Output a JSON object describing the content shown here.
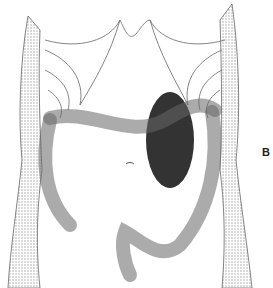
{
  "figure": {
    "panel_label": "B",
    "colors": {
      "background": "#ffffff",
      "line": "#555555",
      "shading": "#bbbbbb",
      "dark_organ": "#333333"
    }
  }
}
